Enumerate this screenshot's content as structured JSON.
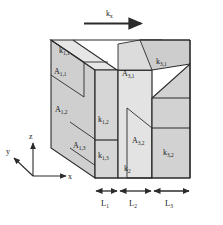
{
  "figure": {
    "title": "",
    "flow_arrow_label": "k",
    "flow_arrow_label_sub": "x"
  },
  "colors": {
    "face_front_light": "#d6d6d6",
    "face_top_mid": "#cfcfcf",
    "face_side_dark": "#c4c4c4",
    "face_pale": "#e3e3e3",
    "outline": "#2b2b2b",
    "text": "#1a1a1a",
    "background": "#ffffff"
  },
  "labels": {
    "k11": {
      "base": "k",
      "sub": "1,1"
    },
    "A11": {
      "base": "A",
      "sub": "1,1"
    },
    "A12": {
      "base": "A",
      "sub": "1,2"
    },
    "A13": {
      "base": "A",
      "sub": "1,3"
    },
    "k12": {
      "base": "k",
      "sub": "1,2"
    },
    "k13": {
      "base": "k",
      "sub": "1,3"
    },
    "k2": {
      "base": "k",
      "sub": "2"
    },
    "A31": {
      "base": "A",
      "sub": "3,1"
    },
    "k31": {
      "base": "k",
      "sub": "3,1"
    },
    "A32": {
      "base": "A",
      "sub": "3,2"
    },
    "k32": {
      "base": "k",
      "sub": "3,2"
    }
  },
  "axes": {
    "x": "x",
    "y": "y",
    "z": "z"
  },
  "dimensions": [
    {
      "base": "L",
      "sub": "1"
    },
    {
      "base": "L",
      "sub": "2"
    },
    {
      "base": "L",
      "sub": "3"
    }
  ]
}
